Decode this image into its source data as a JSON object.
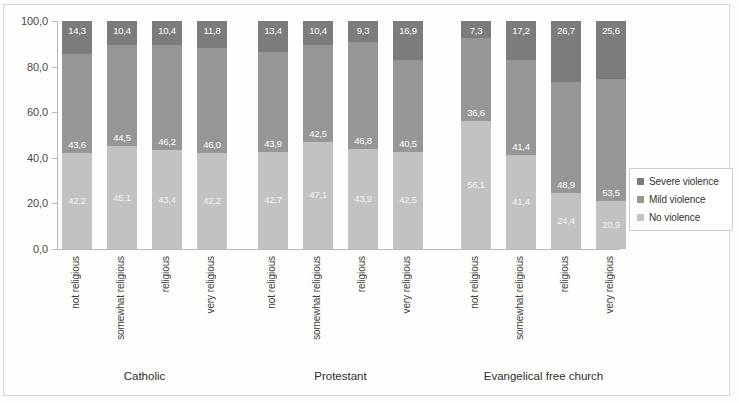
{
  "chart_data": {
    "type": "bar",
    "subtype": "stacked-bar-100-percent",
    "title": "",
    "xlabel": "",
    "ylabel": "",
    "ylim": [
      0,
      100
    ],
    "ytick_labels": [
      "100,0",
      "80,0",
      "60,0",
      "40,0",
      "20,0",
      "0,0"
    ],
    "ytick_values": [
      100,
      80,
      60,
      40,
      20,
      0
    ],
    "grid": false,
    "legend_position": "right",
    "decimal_separator": ",",
    "groups": [
      "Catholic",
      "Protestant",
      "Evangelical free church"
    ],
    "categories": [
      "not religious",
      "somewhat religious",
      "religious",
      "very religious",
      "not religious",
      "somewhat religious",
      "religious",
      "very religious",
      "not religious",
      "somewhat religious",
      "religious",
      "very religious"
    ],
    "series": [
      {
        "name": "No violence",
        "color": "#c2c2c0",
        "values": [
          42.2,
          45.1,
          43.4,
          42.2,
          42.7,
          47.1,
          43.9,
          42.5,
          56.1,
          41.4,
          24.4,
          20.9
        ],
        "labels": [
          "42,2",
          "45,1",
          "43,4",
          "42,2",
          "42,7",
          "47,1",
          "43,9",
          "42,5",
          "56,1",
          "41,4",
          "24,4",
          "20,9"
        ]
      },
      {
        "name": "Mild violence",
        "color": "#969694",
        "values": [
          43.6,
          44.5,
          46.2,
          46.0,
          43.9,
          42.5,
          46.8,
          40.5,
          36.6,
          41.4,
          48.9,
          53.5
        ],
        "labels": [
          "43,6",
          "44,5",
          "46,2",
          "46,0",
          "43,9",
          "42,5",
          "46,8",
          "40,5",
          "36,6",
          "41,4",
          "48,9",
          "53,5"
        ]
      },
      {
        "name": "Severe violence",
        "color": "#7c7c7a",
        "values": [
          14.3,
          10.4,
          10.4,
          11.8,
          13.4,
          10.4,
          9.3,
          16.9,
          7.3,
          17.2,
          26.7,
          25.6
        ],
        "labels": [
          "14,3",
          "10,4",
          "10,4",
          "11,8",
          "13,4",
          "10,4",
          "9,3",
          "16,9",
          "7,3",
          "17,2",
          "26,7",
          "25,6"
        ]
      }
    ]
  },
  "legend": {
    "items": [
      {
        "label": "Severe violence",
        "color": "#7c7c7a"
      },
      {
        "label": "Mild violence",
        "color": "#969694"
      },
      {
        "label": "No violence",
        "color": "#c2c2c0"
      }
    ]
  },
  "axis": {
    "y_ticks": [
      {
        "label": "100,0",
        "value": 100
      },
      {
        "label": "80,0",
        "value": 80
      },
      {
        "label": "60,0",
        "value": 60
      },
      {
        "label": "40,0",
        "value": 40
      },
      {
        "label": "20,0",
        "value": 20
      },
      {
        "label": "0,0",
        "value": 0
      }
    ]
  },
  "groups": [
    {
      "label": "Catholic"
    },
    {
      "label": "Protestant"
    },
    {
      "label": "Evangelical free church"
    }
  ]
}
